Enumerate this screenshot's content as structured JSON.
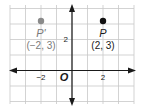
{
  "diagram": {
    "type": "coordinate-plane",
    "x_range": [
      -4,
      4
    ],
    "y_range": [
      -2,
      4
    ],
    "tick_labels": {
      "x": [
        {
          "value": -2,
          "label": "−2"
        },
        {
          "value": 2,
          "label": "2"
        }
      ],
      "y": [
        {
          "value": 2,
          "label": "2"
        }
      ]
    },
    "origin_label": "O",
    "points": [
      {
        "name": "P'",
        "coord_label": "(−2, 3)",
        "x": -2,
        "y": 3,
        "color": "#8a8a8a"
      },
      {
        "name": "P",
        "coord_label": "(2, 3)",
        "x": 2,
        "y": 3,
        "color": "#111111"
      }
    ],
    "colors": {
      "grid": "#c8c8c8",
      "axis": "#1a1a1a",
      "label_gray": "#7a7a7a",
      "label_dark": "#1a1a1a"
    }
  }
}
